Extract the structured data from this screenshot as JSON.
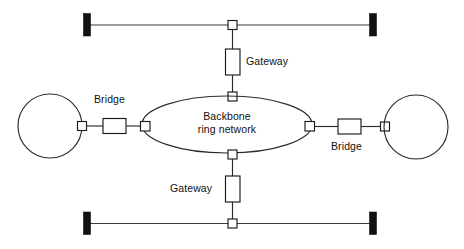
{
  "diagram": {
    "type": "network-topology-diagram",
    "background_color": "#ffffff",
    "line_color": "#2b2b2b",
    "terminator_color": "#111111",
    "labels": {
      "gateway_top": "Gateway",
      "gateway_bottom": "Gateway",
      "bridge_left": "Bridge",
      "bridge_right": "Bridge",
      "backbone_line1": "Backbone",
      "backbone_line2": "ring network"
    },
    "nodes": [
      {
        "id": "bus-top",
        "kind": "bus-segment",
        "label": ""
      },
      {
        "id": "bus-bottom",
        "kind": "bus-segment",
        "label": ""
      },
      {
        "id": "ring-left",
        "kind": "ring-network",
        "label": ""
      },
      {
        "id": "ring-right",
        "kind": "ring-network",
        "label": ""
      },
      {
        "id": "backbone",
        "kind": "backbone-ring",
        "label": "Backbone ring network"
      },
      {
        "id": "gateway-top",
        "kind": "gateway",
        "label": "Gateway"
      },
      {
        "id": "gateway-bottom",
        "kind": "gateway",
        "label": "Gateway"
      },
      {
        "id": "bridge-left",
        "kind": "bridge",
        "label": "Bridge"
      },
      {
        "id": "bridge-right",
        "kind": "bridge",
        "label": "Bridge"
      }
    ],
    "connections": [
      {
        "from": "bus-top",
        "via": "gateway-top",
        "to": "backbone"
      },
      {
        "from": "bus-bottom",
        "via": "gateway-bottom",
        "to": "backbone"
      },
      {
        "from": "ring-left",
        "via": "bridge-left",
        "to": "backbone"
      },
      {
        "from": "ring-right",
        "via": "bridge-right",
        "to": "backbone"
      }
    ]
  }
}
